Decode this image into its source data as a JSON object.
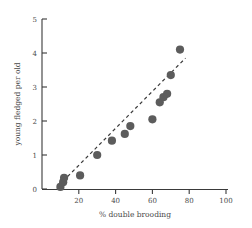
{
  "chart_data": {
    "type": "scatter",
    "title": "",
    "xlabel": "% double brooding",
    "ylabel": "young fledged per old",
    "xlim": [
      0,
      100
    ],
    "ylim": [
      0,
      5
    ],
    "xticks": [
      20,
      40,
      60,
      80,
      100
    ],
    "yticks": [
      0,
      1,
      2,
      3,
      4,
      5
    ],
    "grid": false,
    "legend": null,
    "marker_color": "#5c5c5c",
    "trendline_color": "#3a3a3a",
    "axis_color": "#3a3a3a",
    "points": [
      {
        "x": 10.0,
        "y": 0.06
      },
      {
        "x": 11.5,
        "y": 0.2
      },
      {
        "x": 12.0,
        "y": 0.33
      },
      {
        "x": 20.7,
        "y": 0.4
      },
      {
        "x": 30.0,
        "y": 1.0
      },
      {
        "x": 38.0,
        "y": 1.42
      },
      {
        "x": 45.0,
        "y": 1.62
      },
      {
        "x": 48.0,
        "y": 1.85
      },
      {
        "x": 60.0,
        "y": 2.05
      },
      {
        "x": 64.0,
        "y": 2.55
      },
      {
        "x": 66.0,
        "y": 2.7
      },
      {
        "x": 68.0,
        "y": 2.8
      },
      {
        "x": 70.0,
        "y": 3.35
      },
      {
        "x": 75.0,
        "y": 4.1
      }
    ],
    "trendline": {
      "x1": 9.0,
      "y1": 0.1,
      "x2": 78.0,
      "y2": 3.85,
      "style": "dashed"
    }
  },
  "tick_labels": {
    "x": [
      "20",
      "40",
      "60",
      "80",
      "100"
    ],
    "y": [
      "0",
      "1",
      "2",
      "3",
      "4",
      "5"
    ]
  },
  "labels": {
    "x_axis_title": "% double brooding",
    "y_axis_title": "young fledged per old"
  }
}
